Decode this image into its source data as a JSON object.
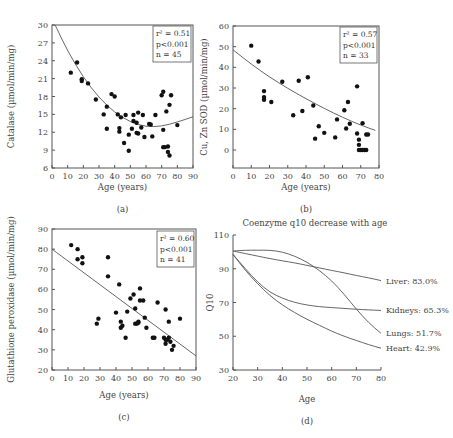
{
  "chart_data": [
    {
      "id": "a",
      "type": "scatter",
      "panel_label": "(a)",
      "xlabel": "Age (years)",
      "ylabel": "Catalase (µmol/min/mg)",
      "xlim": [
        0,
        90
      ],
      "ylim": [
        6,
        30
      ],
      "xticks": [
        0,
        10,
        20,
        30,
        40,
        50,
        60,
        70,
        80,
        90
      ],
      "yticks": [
        6,
        9,
        12,
        15,
        18,
        21,
        24,
        27,
        30
      ],
      "stats": [
        "r² = 0.51",
        "p<0.001",
        "n = 45"
      ],
      "fit": {
        "kind": "quadratic",
        "points": [
          [
            2,
            30
          ],
          [
            10,
            25.6
          ],
          [
            20,
            21.2
          ],
          [
            30,
            17.8
          ],
          [
            40,
            15.3
          ],
          [
            50,
            13.7
          ],
          [
            60,
            12.9
          ],
          [
            70,
            13.0
          ],
          [
            80,
            13.7
          ],
          [
            90,
            14.6
          ]
        ]
      },
      "points": [
        [
          12,
          22
        ],
        [
          16,
          23.7
        ],
        [
          19,
          20.9
        ],
        [
          19,
          20.6
        ],
        [
          23,
          20.2
        ],
        [
          28,
          17.5
        ],
        [
          33,
          15
        ],
        [
          35,
          16.3
        ],
        [
          35,
          12.6
        ],
        [
          38,
          18.4
        ],
        [
          40,
          18
        ],
        [
          42,
          15
        ],
        [
          43,
          12.7
        ],
        [
          43,
          12.1
        ],
        [
          44,
          14.5
        ],
        [
          46,
          10.2
        ],
        [
          47,
          14.9
        ],
        [
          49,
          11.6
        ],
        [
          49,
          8.9
        ],
        [
          51,
          12.6
        ],
        [
          52,
          13.9
        ],
        [
          52,
          14.9
        ],
        [
          54,
          13.6
        ],
        [
          54,
          11.9
        ],
        [
          55,
          15.3
        ],
        [
          55,
          11.8
        ],
        [
          57,
          12.8
        ],
        [
          58,
          14.9
        ],
        [
          59,
          11.2
        ],
        [
          62,
          13.4
        ],
        [
          63,
          13.3
        ],
        [
          64,
          11.3
        ],
        [
          66,
          14.9
        ],
        [
          70,
          18.2
        ],
        [
          71,
          18.8
        ],
        [
          71,
          12.4
        ],
        [
          71,
          9.5
        ],
        [
          72,
          9.5
        ],
        [
          73,
          15.5
        ],
        [
          74,
          9.6
        ],
        [
          74,
          8.7
        ],
        [
          75,
          8.1
        ],
        [
          75,
          16.6
        ],
        [
          76,
          18.2
        ],
        [
          80,
          13.2
        ]
      ]
    },
    {
      "id": "b",
      "type": "scatter",
      "panel_label": "(b)",
      "xlabel": "Age (years)",
      "ylabel": "Cu, Zn SOD (µmol/min/mg)",
      "xlim": [
        0,
        80
      ],
      "ylim": [
        -8,
        60
      ],
      "xticks": [
        0,
        10,
        20,
        30,
        40,
        50,
        60,
        70,
        80
      ],
      "yticks": [
        0,
        10,
        20,
        30,
        40,
        50,
        60
      ],
      "stats": [
        "r² = 0.57",
        "p<0.001",
        "n = 33"
      ],
      "fit": {
        "kind": "exponential",
        "points": [
          [
            0,
            48.5
          ],
          [
            10,
            41.5
          ],
          [
            20,
            35.3
          ],
          [
            30,
            29.8
          ],
          [
            40,
            24.8
          ],
          [
            50,
            20.1
          ],
          [
            60,
            15.8
          ],
          [
            70,
            12.0
          ],
          [
            78,
            9.5
          ]
        ]
      },
      "points": [
        [
          10,
          50.5
        ],
        [
          14,
          42.8
        ],
        [
          17,
          28.5
        ],
        [
          17,
          25.6
        ],
        [
          17,
          24.3
        ],
        [
          21,
          23.2
        ],
        [
          27,
          33
        ],
        [
          33,
          16.8
        ],
        [
          36,
          33.5
        ],
        [
          38,
          18.9
        ],
        [
          41,
          35.2
        ],
        [
          44,
          21.5
        ],
        [
          45,
          5.5
        ],
        [
          47,
          11.5
        ],
        [
          50,
          8.3
        ],
        [
          56,
          6.1
        ],
        [
          57,
          14.8
        ],
        [
          61,
          19.2
        ],
        [
          62,
          10.4
        ],
        [
          63,
          23.2
        ],
        [
          64,
          12.7
        ],
        [
          68,
          30.8
        ],
        [
          68,
          8
        ],
        [
          69,
          5
        ],
        [
          69,
          2.5
        ],
        [
          69,
          0
        ],
        [
          70,
          0
        ],
        [
          71,
          13
        ],
        [
          71,
          0
        ],
        [
          72,
          0
        ],
        [
          73,
          0
        ],
        [
          73,
          7.5
        ],
        [
          74,
          7.5
        ]
      ]
    },
    {
      "id": "c",
      "type": "scatter",
      "panel_label": "(c)",
      "xlabel": "Age (years)",
      "ylabel": "Glutathione peroxidase (µmol/min/mg)",
      "xlim": [
        0,
        90
      ],
      "ylim": [
        20,
        90
      ],
      "xticks": [
        0,
        10,
        20,
        30,
        40,
        50,
        60,
        70,
        80,
        90
      ],
      "yticks": [
        20,
        30,
        40,
        50,
        60,
        70,
        80,
        90
      ],
      "stats": [
        "r² = 0.60",
        "p<0.001",
        "n = 41"
      ],
      "fit": {
        "kind": "linear",
        "points": [
          [
            0,
            80
          ],
          [
            90,
            27
          ]
        ]
      },
      "points": [
        [
          12,
          82
        ],
        [
          16,
          80
        ],
        [
          16,
          75
        ],
        [
          19,
          76
        ],
        [
          19,
          73
        ],
        [
          28,
          43
        ],
        [
          29,
          45.5
        ],
        [
          35,
          76
        ],
        [
          35,
          66.5
        ],
        [
          40,
          48.5
        ],
        [
          42,
          62.5
        ],
        [
          43,
          44
        ],
        [
          43,
          41
        ],
        [
          44,
          42
        ],
        [
          46,
          36
        ],
        [
          47,
          49
        ],
        [
          49,
          55.5
        ],
        [
          51,
          57.5
        ],
        [
          52,
          50.5
        ],
        [
          52,
          43
        ],
        [
          53,
          43
        ],
        [
          54,
          43.5
        ],
        [
          54,
          44
        ],
        [
          55,
          60.5
        ],
        [
          55,
          54.5
        ],
        [
          57,
          54.5
        ],
        [
          58,
          46
        ],
        [
          59,
          41
        ],
        [
          63,
          36
        ],
        [
          64,
          36
        ],
        [
          66,
          53.5
        ],
        [
          70,
          36
        ],
        [
          71,
          50
        ],
        [
          71,
          33
        ],
        [
          71,
          35
        ],
        [
          72,
          35
        ],
        [
          73,
          44
        ],
        [
          73,
          36
        ],
        [
          74,
          34
        ],
        [
          75,
          30
        ],
        [
          76,
          32
        ],
        [
          80,
          45.5
        ]
      ]
    },
    {
      "id": "d",
      "type": "line",
      "panel_label": "(d)",
      "title": "Coenzyme q10 decrease with age",
      "xlabel": "Age",
      "ylabel": "Q10",
      "xlim": [
        20,
        80
      ],
      "ylim": [
        30,
        110
      ],
      "xticks": [
        20,
        30,
        40,
        50,
        60,
        70,
        80
      ],
      "yticks": [
        30,
        50,
        70,
        90,
        110
      ],
      "x": [
        20,
        25,
        30,
        35,
        40,
        45,
        50,
        55,
        60,
        65,
        70,
        75,
        80
      ],
      "series": [
        {
          "name": "Liver",
          "label": "Liver: 83.0%",
          "end_value": 83.0,
          "values": [
            100.5,
            99,
            97.5,
            96,
            94.7,
            93.5,
            92,
            90.5,
            89,
            87.6,
            86,
            84.6,
            83.0
          ]
        },
        {
          "name": "Kidneys",
          "label": "Kidneys: 65.3%",
          "end_value": 65.3,
          "values": [
            98.5,
            90,
            82,
            76,
            72.5,
            70,
            68.5,
            67.5,
            67,
            66.5,
            66,
            65.6,
            65.3
          ]
        },
        {
          "name": "Lungs",
          "label": "Lungs: 51.7%",
          "end_value": 51.7,
          "values": [
            100.5,
            101,
            101,
            101,
            100,
            97.5,
            94,
            89,
            83,
            75,
            66,
            58,
            51.7
          ]
        },
        {
          "name": "Heart",
          "label": "Heart: 42.9%",
          "end_value": 42.9,
          "values": [
            98.5,
            89,
            81,
            74,
            68.5,
            64,
            60,
            56.5,
            53,
            50,
            47.5,
            45,
            42.9
          ]
        }
      ]
    }
  ]
}
